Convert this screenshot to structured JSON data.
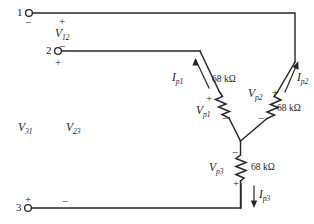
{
  "diagram": {
    "stroke_color": "#262626",
    "text_color": "#1a1a1a",
    "background": "#ffffff"
  },
  "terminals": [
    {
      "id": "terminal-1",
      "number": "1",
      "polarity_below": "−"
    },
    {
      "id": "terminal-2",
      "number": "2",
      "polarity_above": "−",
      "polarity_below": "+"
    },
    {
      "id": "terminal-3",
      "number": "3",
      "polarity_above": "+"
    }
  ],
  "line_voltages": [
    {
      "id": "v12",
      "name": "V",
      "sub": "12",
      "plus": "+",
      "minus": "−"
    },
    {
      "id": "v31",
      "name": "V",
      "sub": "31"
    },
    {
      "id": "v23",
      "name": "V",
      "sub": "23"
    }
  ],
  "phase_voltages": [
    {
      "id": "vp1",
      "name": "V",
      "sub": "p1",
      "plus": "+",
      "minus": "−"
    },
    {
      "id": "vp2",
      "name": "V",
      "sub": "p2",
      "plus": "+",
      "minus": "−"
    },
    {
      "id": "vp3",
      "name": "V",
      "sub": "p3",
      "plus": "+",
      "minus": "−"
    }
  ],
  "phase_currents": [
    {
      "id": "ip1",
      "name": "I",
      "sub": "p1"
    },
    {
      "id": "ip2",
      "name": "I",
      "sub": "p2"
    },
    {
      "id": "ip3",
      "name": "I",
      "sub": "p3"
    }
  ],
  "resistors": [
    {
      "id": "resistor-1",
      "value": "68 kΩ"
    },
    {
      "id": "resistor-2",
      "value": "68 kΩ"
    },
    {
      "id": "resistor-3",
      "value": "68 kΩ"
    }
  ]
}
